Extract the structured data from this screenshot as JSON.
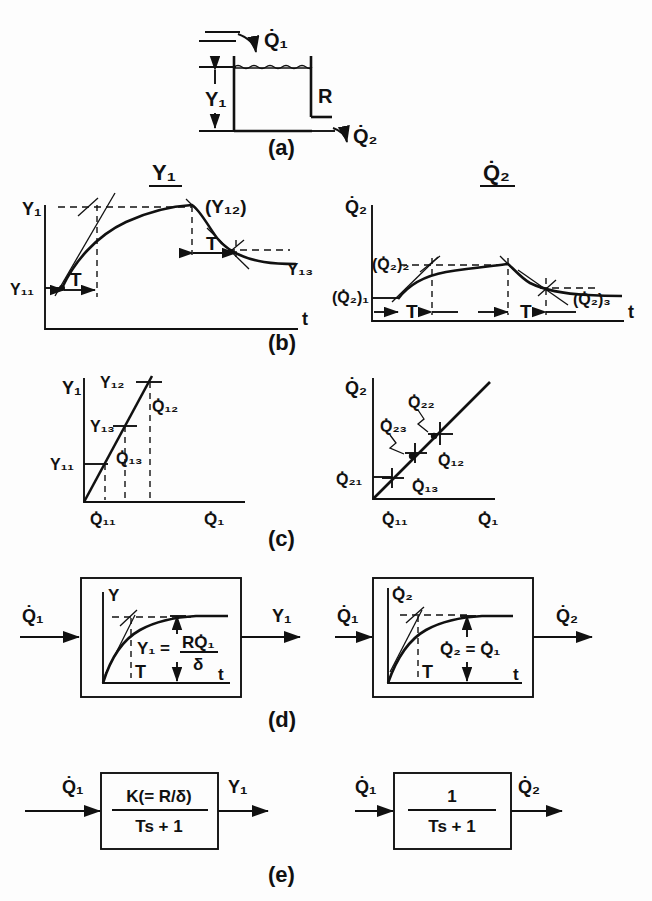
{
  "figure": {
    "title_left": "Y₁",
    "title_right": "Q̇₂",
    "panel_labels": [
      "(a)",
      "(b)",
      "(c)",
      "(d)",
      "(e)"
    ]
  },
  "panel_a": {
    "name": "tank-schematic",
    "inflow_label": "Q̇₁",
    "outflow_label": "Q̇₂",
    "level_label": "Y₁",
    "resistance_label": "R",
    "caption": "(a)"
  },
  "panel_b": {
    "caption": "(b)",
    "left": {
      "ylabel": "Y₁",
      "xlabel": "t",
      "initial_label": "Y₁₁",
      "peak_label": "(Y₁₂)",
      "final_label": "Y₁₃",
      "time_const_label": "T",
      "time_const_label_2": "T"
    },
    "right": {
      "ylabel": "Q̇₂",
      "xlabel": "t",
      "initial_label": "(Q̇₂)₁",
      "peak_label": "(Q̇₂)₂",
      "final_label": "(Q̇₂)₃",
      "time_const_label": "T",
      "time_const_label_2": "T"
    }
  },
  "panel_c": {
    "caption": "(c)",
    "left": {
      "ylabel": "Y₁",
      "xlabel": "Q̇₁",
      "points": [
        "Y₁₁",
        "Y₁₃",
        "Y₁₂"
      ],
      "x_ticks": [
        "Q̇₁₁",
        "Q̇₁₃",
        "Q̇₁₂"
      ]
    },
    "right": {
      "ylabel": "Q̇₂",
      "xlabel": "Q̇₁",
      "y_origin_label": "Q̇₂₁",
      "x_origin_label": "Q̇₁₁",
      "callouts": [
        "Q̇₂₂",
        "Q̇₂₃"
      ],
      "points": [
        "Q̇₁₃",
        "Q̇₁₂"
      ]
    }
  },
  "panel_d": {
    "caption": "(d)",
    "left": {
      "input_label": "Q̇₁",
      "output_label": "Y₁",
      "inner_ylabel": "Y",
      "inner_xlabel": "t",
      "time_const_label": "T",
      "equation_lhs": "Y₁ =",
      "equation_num": "RQ̇₁",
      "equation_den": "δ"
    },
    "right": {
      "input_label": "Q̇₁",
      "output_label": "Q̇₂",
      "inner_ylabel": "Q̇₂",
      "inner_xlabel": "t",
      "time_const_label": "T",
      "equation": "Q̇₂ = Q̇₁"
    }
  },
  "panel_e": {
    "caption": "(e)",
    "left": {
      "input_label": "Q̇₁",
      "output_label": "Y₁",
      "numerator": "K(= R/δ)",
      "denominator": "Ts + 1"
    },
    "right": {
      "input_label": "Q̇₁",
      "output_label": "Q̇₂",
      "numerator": "1",
      "denominator": "Ts + 1"
    }
  },
  "colors": {
    "ink": "#111111",
    "paper": "#fdfdfd"
  }
}
